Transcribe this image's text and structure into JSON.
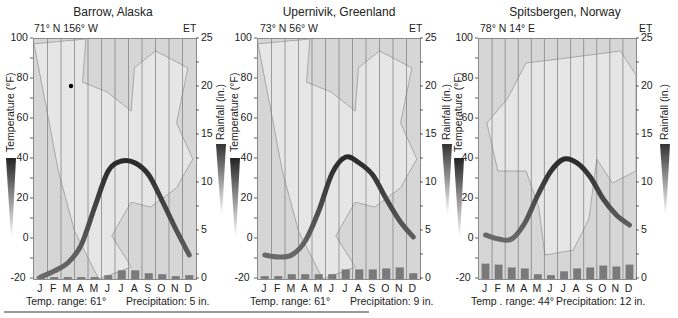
{
  "chart_data": [
    {
      "type": "line",
      "title": "Barrow, Alaska",
      "location": "71° N 156° W",
      "corner_label": "ET",
      "xlabel": "",
      "ylabel": "Temperature (°F)",
      "y2label": "Rainfall (in.)",
      "categories": [
        "J",
        "F",
        "M",
        "A",
        "M",
        "J",
        "J",
        "A",
        "S",
        "O",
        "N",
        "D"
      ],
      "ylim": [
        -20,
        100
      ],
      "y2lim": [
        0,
        25
      ],
      "yticks": [
        -20,
        0,
        20,
        40,
        60,
        80,
        100
      ],
      "y2ticks": [
        0,
        5,
        10,
        15,
        20,
        25
      ],
      "series": [
        {
          "name": "Temperature (°F)",
          "type": "line",
          "values": [
            -19,
            -16,
            -12,
            -3,
            16,
            34,
            39,
            38,
            32,
            19,
            5,
            -8
          ]
        },
        {
          "name": "Precipitation (in.)",
          "type": "bar",
          "values": [
            0.3,
            0.2,
            0.2,
            0.2,
            0.2,
            0.4,
            0.9,
            0.9,
            0.6,
            0.5,
            0.3,
            0.4
          ]
        }
      ],
      "footer_left": "Temp. range: 61°",
      "footer_right": "Precipitation: 5 in."
    },
    {
      "type": "line",
      "title": "Upernivik, Greenland",
      "location": "73° N 56° W",
      "corner_label": "ET",
      "xlabel": "",
      "ylabel": "Temperature (°F)",
      "y2label": "Rainfall (in.)",
      "categories": [
        "J",
        "F",
        "M",
        "A",
        "M",
        "J",
        "J",
        "A",
        "S",
        "O",
        "N",
        "D"
      ],
      "ylim": [
        -20,
        100
      ],
      "y2lim": [
        0,
        25
      ],
      "yticks": [
        -20,
        0,
        20,
        40,
        60,
        80,
        100
      ],
      "y2ticks": [
        0,
        5,
        10,
        15,
        20,
        25
      ],
      "series": [
        {
          "name": "Temperature (°F)",
          "type": "line",
          "values": [
            -8,
            -9,
            -8,
            -1,
            14,
            33,
            41,
            38,
            32,
            20,
            9,
            1
          ]
        },
        {
          "name": "Precipitation (in.)",
          "type": "bar",
          "values": [
            0.3,
            0.3,
            0.5,
            0.5,
            0.5,
            0.5,
            1.0,
            1.0,
            1.0,
            1.1,
            1.2,
            0.6
          ]
        }
      ],
      "footer_left": "Temp. range: 61°",
      "footer_right": "Precipitation: 9 in."
    },
    {
      "type": "line",
      "title": "Spitsbergen, Norway",
      "location": "78° N 14° E",
      "corner_label": "ET",
      "xlabel": "",
      "ylabel": "Temperature (°F)",
      "y2label": "Rainfall (in.)",
      "categories": [
        "J",
        "F",
        "M",
        "A",
        "M",
        "J",
        "J",
        "A",
        "S",
        "O",
        "N",
        "D"
      ],
      "ylim": [
        -20,
        100
      ],
      "y2lim": [
        0,
        25
      ],
      "yticks": [
        -20,
        0,
        20,
        40,
        60,
        80,
        100
      ],
      "y2ticks": [
        0,
        5,
        10,
        15,
        20,
        25
      ],
      "series": [
        {
          "name": "Temperature (°F)",
          "type": "line",
          "values": [
            2,
            0,
            0,
            8,
            22,
            34,
            40,
            38,
            31,
            20,
            12,
            7
          ]
        },
        {
          "name": "Precipitation (in.)",
          "type": "bar",
          "values": [
            1.6,
            1.5,
            1.2,
            1.1,
            0.5,
            0.4,
            0.8,
            1.1,
            1.2,
            1.4,
            1.3,
            1.5
          ]
        }
      ],
      "footer_left": "Temp . range: 44°",
      "footer_right": "Precipitation: 12 in."
    }
  ],
  "colors": {
    "plot_bg": "#d6d6d6",
    "stripe_light": "#e2e2e2",
    "gridline": "#7a7a7a",
    "temp_line_dark": "#2a2a2a",
    "temp_line_light": "#6a6a6a",
    "bar": "#7a7a7a",
    "land": "#e6e6e6",
    "station_dot": "#000000"
  },
  "panels": [
    {
      "title": "Barrow, Alaska",
      "location": "71° N  156° W",
      "et": "ET",
      "footer_left": "Temp. range: 61°",
      "footer_right": "Precipitation: 5 in."
    },
    {
      "title": "Upernivik, Greenland",
      "location": "73° N  56° W",
      "et": "ET",
      "footer_left": "Temp. range: 61°",
      "footer_right": "Precipitation: 9 in."
    },
    {
      "title": "Spitsbergen, Norway",
      "location": "78° N  14° E",
      "et": "ET",
      "footer_left": "Temp . range: 44°",
      "footer_right": "Precipitation: 12 in."
    }
  ],
  "axis": {
    "temp_label": "Temperature (°F)",
    "rain_label": "Rainfall (in.)",
    "temp_ticks": [
      "100",
      "80",
      "60",
      "40",
      "20",
      "0",
      "-20"
    ],
    "rain_ticks": [
      "25",
      "20",
      "15",
      "10",
      "5",
      "0"
    ],
    "months": [
      "J",
      "F",
      "M",
      "A",
      "M",
      "J",
      "J",
      "A",
      "S",
      "O",
      "N",
      "D"
    ]
  }
}
